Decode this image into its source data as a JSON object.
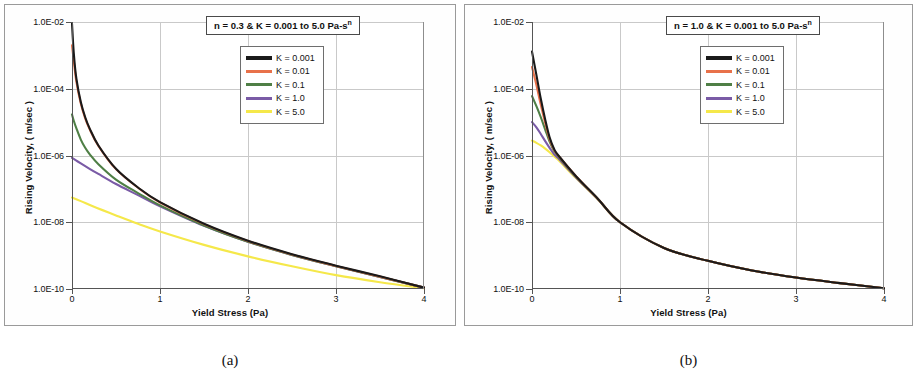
{
  "figure": {
    "caption_a": "(a)",
    "caption_b": "(b)"
  },
  "chart_data": [
    {
      "panel": "a",
      "type": "line",
      "title": "",
      "annotation": "n = 0.3 & K = 0.001 to 5.0 Pa-s",
      "annotation_sup": "n",
      "xlabel": "Yield Stress (Pa)",
      "ylabel": "Rising Velocity,  ( m/sec )",
      "xlim": [
        0,
        4
      ],
      "ylim": [
        1e-10,
        0.01
      ],
      "yscale": "log",
      "grid": true,
      "legend_position": "top-right",
      "xticks": [
        "0",
        "1",
        "2",
        "3",
        "4"
      ],
      "xtick_values": [
        0,
        1,
        2,
        3,
        4
      ],
      "yticks": [
        "1.0E-02",
        "1.0E-04",
        "1.0E-06",
        "1.0E-08",
        "1.0E-10"
      ],
      "ytick_values": [
        0.01,
        0.0001,
        1e-06,
        1e-08,
        1e-10
      ],
      "series": [
        {
          "name": "K = 0.001",
          "color": "#1a1a1a",
          "x": [
            0,
            0.02,
            0.05,
            0.1,
            0.15,
            0.2,
            0.3,
            0.5,
            0.75,
            1.0,
            1.5,
            2.0,
            2.5,
            3.0,
            3.5,
            4.0
          ],
          "values": [
            0.009,
            0.0012,
            0.0002,
            4e-05,
            1.4e-05,
            6.5e-06,
            2e-06,
            4e-07,
            1.1e-07,
            4e-08,
            9e-09,
            2.8e-09,
            1.1e-09,
            5e-10,
            2.4e-10,
            1.1e-10
          ]
        },
        {
          "name": "K = 0.01",
          "color": "#e8714a",
          "x": [
            0,
            0.02,
            0.05,
            0.1,
            0.15,
            0.2,
            0.3,
            0.5,
            0.75,
            1.0,
            1.5,
            2.0,
            2.5,
            3.0,
            3.5,
            4.0
          ],
          "values": [
            0.002,
            0.0007,
            0.00016,
            3.6e-05,
            1.3e-05,
            6.2e-06,
            1.95e-06,
            3.9e-07,
            1.08e-07,
            3.9e-08,
            8.8e-09,
            2.75e-09,
            1.08e-09,
            4.9e-10,
            2.35e-10,
            1.1e-10
          ]
        },
        {
          "name": "K = 0.1",
          "color": "#4f7f46",
          "x": [
            0,
            0.02,
            0.05,
            0.1,
            0.15,
            0.2,
            0.3,
            0.5,
            0.75,
            1.0,
            1.5,
            2.0,
            2.5,
            3.0,
            3.5,
            4.0
          ],
          "values": [
            1.7e-05,
            1.1e-05,
            6.5e-06,
            3e-06,
            1.7e-06,
            1.1e-06,
            5.5e-07,
            1.9e-07,
            7.5e-08,
            3.2e-08,
            8e-09,
            2.6e-09,
            1.05e-09,
            4.8e-10,
            2.3e-10,
            1.1e-10
          ]
        },
        {
          "name": "K = 1.0",
          "color": "#7a5ba6",
          "x": [
            0,
            0.05,
            0.1,
            0.2,
            0.3,
            0.5,
            0.75,
            1.0,
            1.5,
            2.0,
            2.5,
            3.0,
            3.5,
            4.0
          ],
          "values": [
            8.5e-07,
            7e-07,
            5.8e-07,
            4e-07,
            2.8e-07,
            1.4e-07,
            6.5e-08,
            3e-08,
            7.8e-09,
            2.6e-09,
            1.05e-09,
            4.8e-10,
            2.3e-10,
            1.1e-10
          ]
        },
        {
          "name": "K = 5.0",
          "color": "#f5e84a",
          "x": [
            0,
            0.1,
            0.25,
            0.5,
            0.75,
            1.0,
            1.5,
            2.0,
            2.5,
            3.0,
            3.5,
            4.0
          ],
          "values": [
            5.5e-08,
            4.3e-08,
            2.9e-08,
            1.6e-08,
            9e-09,
            5.3e-09,
            2.1e-09,
            9.5e-10,
            4.8e-10,
            2.6e-10,
            1.6e-10,
            1.05e-10
          ]
        }
      ]
    },
    {
      "panel": "b",
      "type": "line",
      "title": "",
      "annotation": "n = 1.0 & K = 0.001 to 5.0 Pa-s",
      "annotation_sup": "n",
      "xlabel": "Yield Stress (Pa)",
      "ylabel": "Rising Velocity,  ( m/sec )",
      "xlim": [
        0,
        4
      ],
      "ylim": [
        1e-10,
        0.01
      ],
      "yscale": "log",
      "grid": true,
      "legend_position": "top-right",
      "xticks": [
        "0",
        "1",
        "2",
        "3",
        "4"
      ],
      "xtick_values": [
        0,
        1,
        2,
        3,
        4
      ],
      "yticks": [
        "1.0E-02",
        "1.0E-04",
        "1.0E-06",
        "1.0E-08",
        "1.0E-10"
      ],
      "ytick_values": [
        0.01,
        0.0001,
        1e-06,
        1e-08,
        1e-10
      ],
      "series": [
        {
          "name": "K = 0.001",
          "color": "#1a1a1a",
          "x": [
            0,
            0.05,
            0.1,
            0.15,
            0.2,
            0.25,
            0.3,
            0.5,
            0.75,
            1.0,
            1.5,
            2.0,
            2.5,
            3.0,
            3.5,
            4.0
          ],
          "values": [
            0.0013,
            0.00026,
            5e-05,
            1.2e-05,
            3.5e-06,
            1.6e-06,
            1e-06,
            2.4e-07,
            5e-08,
            1e-08,
            1.7e-09,
            7e-10,
            3.6e-10,
            2.2e-10,
            1.5e-10,
            1.05e-10
          ]
        },
        {
          "name": "K = 0.01",
          "color": "#e8714a",
          "x": [
            0,
            0.05,
            0.1,
            0.15,
            0.2,
            0.25,
            0.3,
            0.5,
            0.75,
            1.0,
            1.5,
            2.0,
            2.5,
            3.0,
            3.5,
            4.0
          ],
          "values": [
            0.00045,
            0.00013,
            3.3e-05,
            9.5e-06,
            3.1e-06,
            1.5e-06,
            9.8e-07,
            2.4e-07,
            5e-08,
            1e-08,
            1.7e-09,
            7e-10,
            3.6e-10,
            2.2e-10,
            1.5e-10,
            1.05e-10
          ]
        },
        {
          "name": "K = 0.1",
          "color": "#4f7f46",
          "x": [
            0,
            0.05,
            0.1,
            0.15,
            0.2,
            0.25,
            0.3,
            0.5,
            0.75,
            1.0,
            1.5,
            2.0,
            2.5,
            3.0,
            3.5,
            4.0
          ],
          "values": [
            6e-05,
            3e-05,
            1.4e-05,
            6e-06,
            2.6e-06,
            1.4e-06,
            9.3e-07,
            2.3e-07,
            5e-08,
            1e-08,
            1.7e-09,
            7e-10,
            3.6e-10,
            2.2e-10,
            1.5e-10,
            1.05e-10
          ]
        },
        {
          "name": "K = 1.0",
          "color": "#7a5ba6",
          "x": [
            0,
            0.05,
            0.1,
            0.15,
            0.2,
            0.25,
            0.3,
            0.5,
            0.75,
            1.0,
            1.5,
            2.0,
            2.5,
            3.0,
            3.5,
            4.0
          ],
          "values": [
            1e-05,
            7e-06,
            4.4e-06,
            2.7e-06,
            1.7e-06,
            1.1e-06,
            8.2e-07,
            2.2e-07,
            4.9e-08,
            1e-08,
            1.7e-09,
            7e-10,
            3.6e-10,
            2.2e-10,
            1.5e-10,
            1.05e-10
          ]
        },
        {
          "name": "K = 5.0",
          "color": "#f5e84a",
          "x": [
            0,
            0.05,
            0.1,
            0.15,
            0.2,
            0.25,
            0.3,
            0.5,
            0.75,
            1.0,
            1.5,
            2.0,
            2.5,
            3.0,
            3.5,
            4.0
          ],
          "values": [
            2.8e-06,
            2.4e-06,
            2e-06,
            1.6e-06,
            1.25e-06,
            9.5e-07,
            7.3e-07,
            2.1e-07,
            4.8e-08,
            1e-08,
            1.7e-09,
            7e-10,
            3.6e-10,
            2.2e-10,
            1.5e-10,
            1.05e-10
          ]
        }
      ]
    }
  ]
}
